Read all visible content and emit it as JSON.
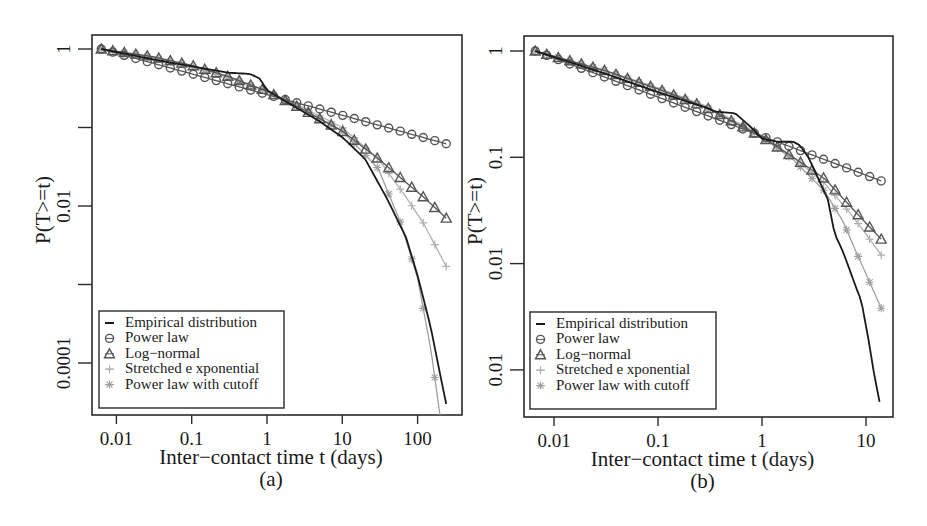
{
  "chart_data": [
    {
      "panel": "(a)",
      "type": "line",
      "title": "",
      "caption": "(a)",
      "xlabel": "Inter−contact time t (days)",
      "ylabel": "P(T>=t)",
      "xscale": "log",
      "yscale": "log",
      "xlim": [
        0.0045,
        400
      ],
      "ylim": [
        9.5e-06,
        1.5
      ],
      "xticks": [
        0.01,
        0.1,
        1,
        10,
        100
      ],
      "xtick_labels": [
        "0.01",
        "0.1",
        "1",
        "10",
        "100"
      ],
      "yticks": [
        1,
        0.1,
        0.01,
        0.001,
        0.0001
      ],
      "ytick_labels": [
        "1",
        "",
        "0.01",
        "",
        "0.0001"
      ],
      "grid": false,
      "legend_position": "lower left",
      "legend": [
        "Empirical distribution",
        "Power law",
        "Log−normal",
        "Stretched e xponential",
        "Power law with cutoff"
      ],
      "series": [
        {
          "name": "Empirical distribution",
          "marker": "none",
          "color": "#1a1a1a",
          "x": [
            0.0063,
            0.03,
            0.1,
            0.3,
            0.6,
            0.8,
            1.0,
            2,
            5,
            10,
            20,
            40,
            70,
            100,
            150,
            200,
            240
          ],
          "y": [
            1.0,
            0.74,
            0.6,
            0.5,
            0.48,
            0.42,
            0.3,
            0.2,
            0.12,
            0.075,
            0.04,
            0.012,
            0.004,
            0.0013,
            0.00028,
            7e-05,
            3e-05
          ]
        },
        {
          "name": "Power law",
          "marker": "circle",
          "color": "#555555",
          "x": [
            0.0063,
            240
          ],
          "y": [
            1.0,
            0.062
          ]
        },
        {
          "name": "Log−normal",
          "marker": "triangle",
          "color": "#555555",
          "x": [
            0.0063,
            0.03,
            0.1,
            0.3,
            1,
            3,
            10,
            30,
            70,
            120,
            240
          ],
          "y": [
            1.0,
            0.8,
            0.62,
            0.45,
            0.29,
            0.17,
            0.09,
            0.04,
            0.02,
            0.013,
            0.007
          ]
        },
        {
          "name": "Stretched e xponential",
          "marker": "plus",
          "color": "#b0b0b0",
          "x": [
            0.0063,
            0.03,
            0.1,
            0.3,
            1,
            3,
            10,
            30,
            70,
            120,
            240
          ],
          "y": [
            1.0,
            0.79,
            0.6,
            0.44,
            0.29,
            0.18,
            0.1,
            0.04,
            0.013,
            0.006,
            0.0017
          ]
        },
        {
          "name": "Power law with cutoff",
          "marker": "x",
          "color": "#a0a0a0",
          "x": [
            0.0063,
            0.03,
            0.1,
            0.3,
            1,
            3,
            10,
            30,
            60,
            100,
            150,
            200,
            240
          ],
          "y": [
            1.0,
            0.78,
            0.6,
            0.44,
            0.29,
            0.17,
            0.09,
            0.03,
            0.006,
            0.0012,
            0.00015,
            2e-05,
            1e-05
          ]
        }
      ]
    },
    {
      "panel": "(b)",
      "type": "line",
      "title": "",
      "caption": "(b)",
      "xlabel": "Inter−contact time t (days)",
      "ylabel": "P(T>=t)",
      "xscale": "log",
      "yscale": "log",
      "xlim": [
        0.0045,
        20
      ],
      "ylim": [
        0.00035,
        1.4
      ],
      "xticks": [
        0.01,
        0.1,
        1,
        10
      ],
      "xtick_labels": [
        "0.01",
        "0.1",
        "1",
        "10"
      ],
      "yticks": [
        1,
        0.1,
        0.01,
        0.001
      ],
      "ytick_labels": [
        "1",
        "0.1",
        "0.01",
        "0.01"
      ],
      "grid": false,
      "legend_position": "lower left",
      "legend": [
        "Empirical distribution",
        "Power law",
        "Log−normal",
        "Stretched e xponential",
        "Power law with cutoff"
      ],
      "series": [
        {
          "name": "Empirical distribution",
          "marker": "none",
          "color": "#1a1a1a",
          "x": [
            0.0066,
            0.03,
            0.1,
            0.3,
            0.35,
            0.55,
            0.75,
            1.0,
            1.4,
            2.0,
            2.3,
            2.8,
            4.3,
            5.0,
            6.0,
            7.2,
            8.0,
            9.0,
            10.5,
            12.0,
            13.5
          ],
          "y": [
            1.0,
            0.62,
            0.41,
            0.29,
            0.27,
            0.26,
            0.2,
            0.15,
            0.14,
            0.14,
            0.13,
            0.1,
            0.04,
            0.019,
            0.013,
            0.008,
            0.006,
            0.0045,
            0.002,
            0.0009,
            0.0005
          ]
        },
        {
          "name": "Power law",
          "marker": "circle",
          "color": "#555555",
          "x": [
            0.0066,
            14
          ],
          "y": [
            1.0,
            0.06
          ]
        },
        {
          "name": "Log−normal",
          "marker": "triangle",
          "color": "#555555",
          "x": [
            0.0066,
            0.03,
            0.1,
            0.3,
            1,
            2,
            4,
            7,
            10,
            14
          ],
          "y": [
            1.0,
            0.66,
            0.44,
            0.29,
            0.155,
            0.1,
            0.063,
            0.035,
            0.024,
            0.017
          ]
        },
        {
          "name": "Stretched e xponential",
          "marker": "plus",
          "color": "#b0b0b0",
          "x": [
            0.0066,
            0.03,
            0.1,
            0.3,
            1,
            2,
            4,
            7,
            10,
            14
          ],
          "y": [
            1.0,
            0.66,
            0.45,
            0.3,
            0.16,
            0.1,
            0.057,
            0.03,
            0.019,
            0.012
          ]
        },
        {
          "name": "Power law with cutoff",
          "marker": "x",
          "color": "#a0a0a0",
          "x": [
            0.0066,
            0.03,
            0.1,
            0.3,
            1,
            2,
            4,
            6,
            8,
            10,
            14
          ],
          "y": [
            1.0,
            0.66,
            0.44,
            0.29,
            0.155,
            0.095,
            0.048,
            0.025,
            0.013,
            0.008,
            0.0038
          ]
        }
      ]
    }
  ],
  "panels": [
    {
      "caption": "(a)",
      "xlabel": "Inter−contact time t (days)",
      "ylabel": "P(T>=t)",
      "frame": {
        "x": 92,
        "y": 35,
        "w": 370,
        "h": 380
      },
      "xmap": {
        "origin": 267,
        "perDecade": 75.3
      },
      "ymap": {
        "origin": 49,
        "perDecade": 78.5
      },
      "legend_box": {
        "x": 99,
        "y": 311,
        "w": 185,
        "h": 97
      }
    },
    {
      "caption": "(b)",
      "xlabel": "Inter−contact time t (days)",
      "ylabel": "P(T>=t)",
      "frame": {
        "x": 524,
        "y": 36,
        "w": 369,
        "h": 381
      },
      "xmap": {
        "origin": 762,
        "perDecade": 104
      },
      "ymap": {
        "origin": 51,
        "perDecade": 106.3
      },
      "legend_box": {
        "x": 530,
        "y": 312,
        "w": 186,
        "h": 97
      }
    }
  ],
  "legend_labels": [
    "Empirical distribution",
    "Power law",
    "Log−normal",
    "Stretched e xponential",
    "Power law with cutoff"
  ]
}
